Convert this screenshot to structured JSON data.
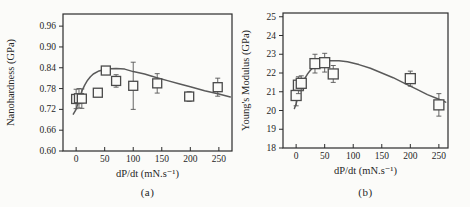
{
  "figure": {
    "background": "#fbfbf9",
    "caption_a": "(a)",
    "caption_b": "(b)"
  },
  "colors": {
    "frame": "#2b2b2b",
    "marker": "#4a4a4a",
    "error_bar": "#555555",
    "curve": "#5a5a5a",
    "text": "#262626",
    "background": "#fbfbf9"
  },
  "chart_data": [
    {
      "type": "scatter",
      "title": "",
      "xlabel": "dP/dt (mN.s⁻¹)",
      "ylabel": "Nanohardness (GPa)",
      "caption": "(a)",
      "xlim": [
        -23,
        273
      ],
      "ylim": [
        0.6,
        0.995
      ],
      "xticks": [
        0,
        50,
        100,
        150,
        200,
        250
      ],
      "yticks": [
        0.6,
        0.66,
        0.72,
        0.78,
        0.84,
        0.9,
        0.96
      ],
      "ytick_decimals": 2,
      "grid": false,
      "legend": null,
      "marker": "open-square",
      "points": [
        {
          "x": 0,
          "y": 0.75,
          "yerr": 0.028
        },
        {
          "x": 5,
          "y": 0.752,
          "yerr": 0.028
        },
        {
          "x": 10,
          "y": 0.751,
          "yerr": 0.028
        },
        {
          "x": 38,
          "y": 0.768,
          "yerr": 0.008
        },
        {
          "x": 52,
          "y": 0.832,
          "yerr": 0.01
        },
        {
          "x": 70,
          "y": 0.802,
          "yerr": 0.018
        },
        {
          "x": 100,
          "y": 0.788,
          "yerr": 0.068
        },
        {
          "x": 142,
          "y": 0.795,
          "yerr": 0.028
        },
        {
          "x": 198,
          "y": 0.757,
          "yerr": 0.014
        },
        {
          "x": 248,
          "y": 0.784,
          "yerr": 0.026
        }
      ],
      "fit_curve": {
        "x": [
          -5,
          0,
          5,
          10,
          15,
          20,
          25,
          30,
          40,
          50,
          60,
          70,
          85,
          100,
          120,
          140,
          160,
          180,
          200,
          225,
          250,
          270
        ],
        "y": [
          0.706,
          0.72,
          0.748,
          0.772,
          0.79,
          0.804,
          0.814,
          0.822,
          0.831,
          0.835,
          0.837,
          0.838,
          0.836,
          0.829,
          0.822,
          0.812,
          0.803,
          0.794,
          0.785,
          0.774,
          0.764,
          0.756
        ]
      }
    },
    {
      "type": "scatter",
      "title": "",
      "xlabel": "dP/dt (mN.s⁻¹)",
      "ylabel": "Young's Modulus (GPa)",
      "caption": "(b)",
      "xlim": [
        -23,
        266
      ],
      "ylim": [
        18,
        25.2
      ],
      "xticks": [
        0,
        50,
        100,
        150,
        200,
        250
      ],
      "yticks": [
        18,
        19,
        20,
        21,
        22,
        23,
        24,
        25
      ],
      "ytick_decimals": 0,
      "grid": false,
      "legend": null,
      "marker": "open-square",
      "points": [
        {
          "x": 0,
          "y": 20.8,
          "yerr": 0.55
        },
        {
          "x": 4,
          "y": 21.35,
          "yerr": 0.45
        },
        {
          "x": 9,
          "y": 21.45,
          "yerr": 0.4
        },
        {
          "x": 33,
          "y": 22.5,
          "yerr": 0.5
        },
        {
          "x": 50,
          "y": 22.55,
          "yerr": 0.5
        },
        {
          "x": 65,
          "y": 21.95,
          "yerr": 0.45
        },
        {
          "x": 200,
          "y": 21.7,
          "yerr": 0.4
        },
        {
          "x": 250,
          "y": 20.3,
          "yerr": 0.6
        }
      ],
      "fit_curve": {
        "x": [
          -3,
          0,
          3,
          6,
          10,
          15,
          20,
          25,
          30,
          40,
          50,
          60,
          75,
          90,
          110,
          130,
          150,
          170,
          190,
          210,
          230,
          250,
          262
        ],
        "y": [
          20.1,
          20.35,
          20.7,
          21.0,
          21.35,
          21.7,
          21.95,
          22.15,
          22.3,
          22.5,
          22.6,
          22.65,
          22.65,
          22.6,
          22.45,
          22.25,
          22.0,
          21.75,
          21.45,
          21.15,
          20.85,
          20.6,
          20.45
        ]
      }
    }
  ]
}
